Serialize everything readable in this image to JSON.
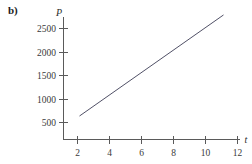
{
  "panel": {
    "label": "b)"
  },
  "chart_data": {
    "type": "line",
    "title": "",
    "xlabel": "t",
    "ylabel": "P",
    "xlim": [
      0,
      12.8
    ],
    "ylim": [
      0,
      2800
    ],
    "grid": false,
    "legend": null,
    "xticks": [
      2,
      4,
      6,
      8,
      10,
      12
    ],
    "xtick_labels": [
      "2",
      "4",
      "6",
      "8",
      "10",
      "12"
    ],
    "yticks": [
      500,
      1000,
      1500,
      2000,
      2500
    ],
    "ytick_labels": [
      "500",
      "1000",
      "1500",
      "2000",
      "2500"
    ],
    "series": [
      {
        "name": "P(t)",
        "color": "#3c3c55",
        "x": [
          1,
          10
        ],
        "values": [
          500,
          2650
        ]
      }
    ],
    "annotations": []
  }
}
